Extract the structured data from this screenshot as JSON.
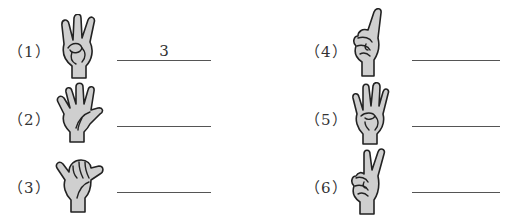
{
  "worksheet": {
    "items": [
      {
        "label": "（1）",
        "gesture": "three-fingers",
        "answer": "3"
      },
      {
        "label": "（2）",
        "gesture": "open-hand-five",
        "answer": ""
      },
      {
        "label": "（3）",
        "gesture": "thumb-pinky-six",
        "answer": ""
      },
      {
        "label": "（4）",
        "gesture": "one-finger",
        "answer": ""
      },
      {
        "label": "（5）",
        "gesture": "four-fingers",
        "answer": ""
      },
      {
        "label": "（6）",
        "gesture": "two-fingers",
        "answer": ""
      }
    ]
  }
}
